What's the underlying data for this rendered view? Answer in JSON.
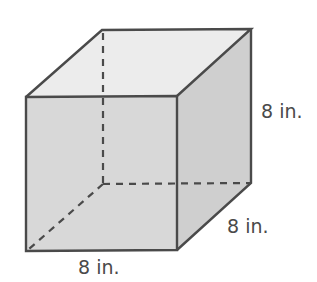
{
  "figure": {
    "type": "cube",
    "colors": {
      "background": "#ffffff",
      "edge": "#4a4a4a",
      "front_face": "#d8d8d8",
      "top_face": "#ececec",
      "right_face": "#cfcfcf"
    },
    "vertices": {
      "front_top_left": [
        26,
        97
      ],
      "front_top_right": [
        177,
        96
      ],
      "front_bottom_left": [
        26,
        251
      ],
      "front_bottom_right": [
        177,
        250
      ],
      "back_top_left": [
        102,
        30
      ],
      "back_top_right": [
        251,
        29
      ],
      "back_bottom_right": [
        251,
        183
      ],
      "back_bottom_left_hidden": [
        103,
        184
      ]
    },
    "labels": {
      "height": "8 in.",
      "depth": "8 in.",
      "width": "8 in."
    }
  }
}
